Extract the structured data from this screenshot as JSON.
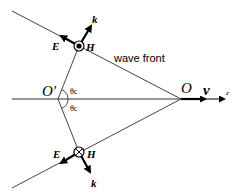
{
  "diagram": {
    "labels": {
      "wave_front": "wave front",
      "origin_O": "O",
      "origin_O_prime": "O′",
      "velocity": "v",
      "axis_z": "z",
      "theta_upper": "θc",
      "theta_lower": "θc",
      "E_upper": "E",
      "H_upper": "H",
      "k_upper": "k",
      "E_lower": "E",
      "H_lower": "H",
      "k_lower": "k"
    },
    "points": {
      "O": [
        181,
        99
      ],
      "O_prime": [
        58,
        99
      ],
      "H_upper_center": [
        79,
        46
      ],
      "H_lower_center": [
        79,
        152
      ]
    },
    "markers": {
      "H_upper": "dot-in-circle (out of page)",
      "H_lower": "cross-in-circle (into page)"
    },
    "colors": {
      "line": "#000000",
      "thin_line": "#444444",
      "background": "#ffffff"
    }
  }
}
